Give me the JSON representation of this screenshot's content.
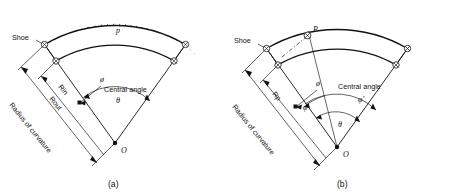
{
  "figure": {
    "captions": {
      "a": "(a)",
      "b": "(b)"
    }
  },
  "panel_a": {
    "shoe_label": "Shoe",
    "pressure_label": "p",
    "r_inner_label": "Rin",
    "r_outer_label": "Rout",
    "radius_label": "Radius of curvature",
    "central_angle_label": "Central angle",
    "phi_label": "ø",
    "theta_label": "θ",
    "origin_label": "O"
  },
  "panel_b": {
    "shoe_label": "Shoe",
    "point_label": "P",
    "r_p_label": "Rp",
    "radius_label": "Radius of curvature",
    "central_angle_label": "Central angle",
    "phi_label": "ø",
    "phi_lower_label": "φ",
    "phi_prime_label": "φ′",
    "theta_label": "θ",
    "origin_label": "O"
  },
  "colors": {
    "ink": "#111111",
    "paper": "#ffffff"
  }
}
